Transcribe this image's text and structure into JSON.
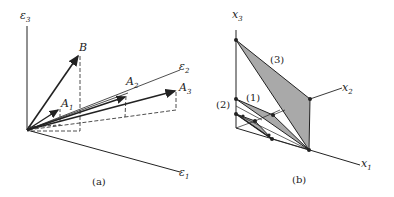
{
  "figure_a": {
    "caption": "(a)",
    "axes": {
      "e1": "ε",
      "e1_sub": "1",
      "e2": "ε",
      "e2_sub": "2",
      "e3": "ε",
      "e3_sub": "3"
    },
    "vectors": {
      "B": "B",
      "A1": "A",
      "A1_sub": "1",
      "A2": "A",
      "A2_sub": "2",
      "A3": "A",
      "A3_sub": "3"
    }
  },
  "figure_b": {
    "caption": "(b)",
    "axes": {
      "x1": "x",
      "x1_sub": "1",
      "x2": "x",
      "x2_sub": "2",
      "x3": "x",
      "x3_sub": "3"
    },
    "regions": {
      "r1": "(1)",
      "r2": "(2)",
      "r3": "(3)"
    }
  },
  "colors": {
    "ink": "#222222",
    "fill": "#a9a9a9"
  }
}
